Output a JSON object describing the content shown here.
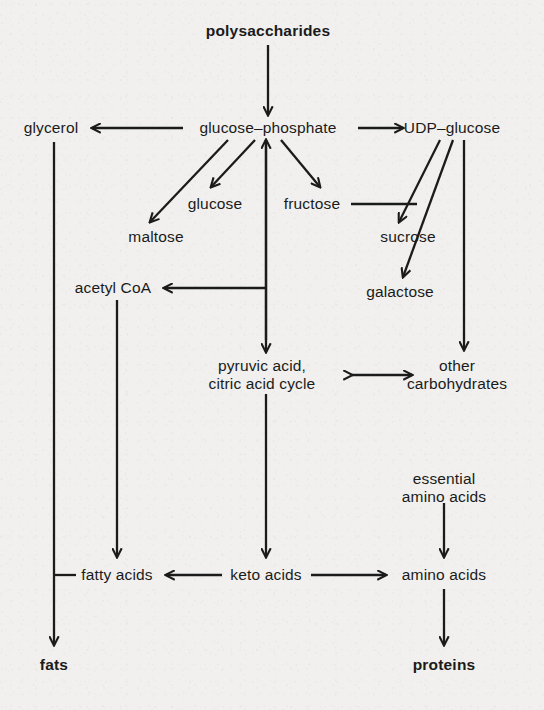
{
  "diagram": {
    "background_color": "#f1f0ee",
    "ink_color": "#1b1b1b",
    "nodes": [
      {
        "id": "polysaccharides",
        "label": "polysaccharides",
        "line2": "",
        "x": 268,
        "y": 31,
        "bold": true
      },
      {
        "id": "glycerol",
        "label": "glycerol",
        "line2": "",
        "x": 51,
        "y": 128,
        "bold": false
      },
      {
        "id": "glucose_phosphate",
        "label": "glucose–phosphate",
        "line2": "",
        "x": 268,
        "y": 128,
        "bold": false
      },
      {
        "id": "udp_glucose",
        "label": "UDP–glucose",
        "line2": "",
        "x": 452,
        "y": 128,
        "bold": false
      },
      {
        "id": "glucose",
        "label": "glucose",
        "line2": "",
        "x": 215,
        "y": 204,
        "bold": false
      },
      {
        "id": "fructose",
        "label": "fructose",
        "line2": "",
        "x": 312,
        "y": 204,
        "bold": false
      },
      {
        "id": "maltose",
        "label": "maltose",
        "line2": "",
        "x": 156,
        "y": 237,
        "bold": false
      },
      {
        "id": "sucrose",
        "label": "sucrose",
        "line2": "",
        "x": 408,
        "y": 237,
        "bold": false
      },
      {
        "id": "galactose",
        "label": "galactose",
        "line2": "",
        "x": 400,
        "y": 292,
        "bold": false
      },
      {
        "id": "acetyl_coa",
        "label": "acetyl CoA",
        "line2": "",
        "x": 113,
        "y": 288,
        "bold": false
      },
      {
        "id": "pyruvic",
        "label": "pyruvic acid,",
        "line2": "citric acid cycle",
        "x": 262,
        "y": 374,
        "bold": false
      },
      {
        "id": "other_carbs",
        "label": "other",
        "line2": "carbohydrates",
        "x": 457,
        "y": 374,
        "bold": false
      },
      {
        "id": "essential_aa",
        "label": "essential",
        "line2": "amino acids",
        "x": 444,
        "y": 487,
        "bold": false
      },
      {
        "id": "fatty_acids",
        "label": "fatty acids",
        "line2": "",
        "x": 117,
        "y": 575,
        "bold": false
      },
      {
        "id": "keto_acids",
        "label": "keto acids",
        "line2": "",
        "x": 266,
        "y": 575,
        "bold": false
      },
      {
        "id": "amino_acids",
        "label": "amino acids",
        "line2": "",
        "x": 444,
        "y": 575,
        "bold": false
      },
      {
        "id": "fats",
        "label": "fats",
        "line2": "",
        "x": 54,
        "y": 665,
        "bold": true
      },
      {
        "id": "proteins",
        "label": "proteins",
        "line2": "",
        "x": 444,
        "y": 665,
        "bold": true
      }
    ],
    "edges": [
      {
        "from": "polysaccharides",
        "to": "glucose_phosphate",
        "kind": "arrow-down",
        "note": "polysaccharides degrade to glucose-phosphate"
      },
      {
        "from": "glucose_phosphate",
        "to": "glycerol",
        "kind": "arrow-left",
        "note": "glucose-phosphate to glycerol"
      },
      {
        "from": "glucose_phosphate",
        "to": "udp_glucose",
        "kind": "arrow-right",
        "note": "glucose-phosphate to UDP-glucose"
      },
      {
        "from": "glucose_phosphate",
        "to": "maltose",
        "kind": "arrow-diag",
        "note": "glucose-phosphate to maltose"
      },
      {
        "from": "glucose_phosphate",
        "to": "glucose",
        "kind": "arrow-diag",
        "note": "glucose-phosphate to glucose"
      },
      {
        "from": "glucose_phosphate",
        "to": "fructose",
        "kind": "arrow-diag",
        "note": "glucose-phosphate to fructose"
      },
      {
        "from": "pyruvic",
        "to": "glucose_phosphate",
        "kind": "arrow-up",
        "note": "pyruvic acid back to glucose-phosphate"
      },
      {
        "from": "glucose_phosphate",
        "to": "pyruvic",
        "kind": "arrow-down",
        "note": "glucose-phosphate to pyruvic acid / citric acid cycle"
      },
      {
        "from": "glucose_phosphate",
        "to": "acetyl_coa",
        "kind": "arrow-left",
        "note": "branch to acetyl CoA"
      },
      {
        "from": "udp_glucose",
        "to": "sucrose",
        "kind": "arrow-diag",
        "note": "UDP-glucose to sucrose"
      },
      {
        "from": "fructose",
        "to": "sucrose",
        "kind": "line",
        "note": "fructose joins sucrose synthesis"
      },
      {
        "from": "udp_glucose",
        "to": "galactose",
        "kind": "arrow-diag",
        "note": "UDP-glucose to galactose"
      },
      {
        "from": "udp_glucose",
        "to": "other_carbs",
        "kind": "arrow-down",
        "note": "UDP-glucose to other carbohydrates"
      },
      {
        "from": "pyruvic",
        "to": "other_carbs",
        "kind": "arrow-both",
        "note": "reversible interconversion"
      },
      {
        "from": "glycerol",
        "to": "fats",
        "kind": "arrow-down",
        "note": "glycerol to fats"
      },
      {
        "from": "acetyl_coa",
        "to": "fatty_acids",
        "kind": "arrow-down",
        "note": "acetyl CoA to fatty acids"
      },
      {
        "from": "fatty_acids",
        "to": "fats",
        "kind": "line",
        "note": "fatty acids join glycerol to form fats"
      },
      {
        "from": "pyruvic",
        "to": "keto_acids",
        "kind": "arrow-down",
        "note": "citric acid cycle to keto acids"
      },
      {
        "from": "keto_acids",
        "to": "fatty_acids",
        "kind": "arrow-left",
        "note": "keto acids to fatty acids"
      },
      {
        "from": "keto_acids",
        "to": "amino_acids",
        "kind": "arrow-right",
        "note": "keto acids to amino acids"
      },
      {
        "from": "essential_aa",
        "to": "amino_acids",
        "kind": "arrow-down",
        "note": "essential amino acids feed amino acid pool"
      },
      {
        "from": "amino_acids",
        "to": "proteins",
        "kind": "arrow-down",
        "note": "amino acids to proteins"
      }
    ]
  }
}
